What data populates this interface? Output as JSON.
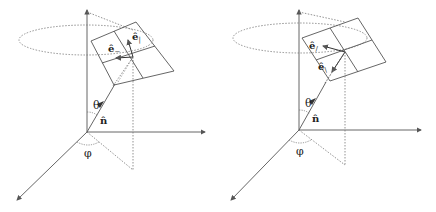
{
  "figure": {
    "panels": [
      {
        "id": "left",
        "labels": {
          "theta": "θ",
          "phi": "φ",
          "n_hat": "n̂",
          "e_perp": "ê",
          "e_perp_sub": "−",
          "e_par": "ê",
          "e_par_sub": "|"
        }
      },
      {
        "id": "right",
        "labels": {
          "theta": "θ",
          "phi": "φ",
          "n_hat": "n̂",
          "e_a": "ê",
          "e_a_sub": "/",
          "e_b": "ê",
          "e_b_sub": "\\"
        }
      }
    ],
    "colors": {
      "line": "#555555",
      "dotted": "#777777",
      "background": "#ffffff"
    }
  }
}
